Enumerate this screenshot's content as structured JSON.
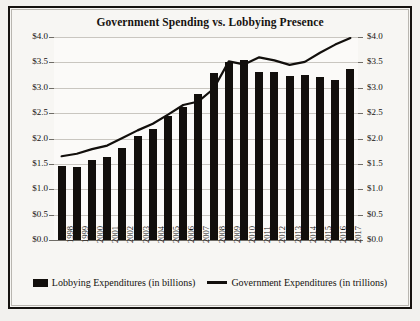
{
  "chart_data": {
    "type": "bar",
    "title": "Government Spending vs. Lobbying Presence",
    "xlabel": "",
    "ylabel": "",
    "ylim": [
      0.0,
      4.0
    ],
    "ytick_step": 0.5,
    "grid": true,
    "legend_position": "bottom",
    "dual_axis": true,
    "categories": [
      "1998",
      "1999",
      "2000",
      "2001",
      "2002",
      "2003",
      "2004",
      "2005",
      "2006",
      "2007",
      "2008",
      "2009",
      "2010",
      "2011",
      "2012",
      "2013",
      "2014",
      "2015",
      "2016",
      "2017"
    ],
    "yticks": [
      "$0.0",
      "$0.5",
      "$1.0",
      "$1.5",
      "$2.0",
      "$2.5",
      "$3.0",
      "$3.5",
      "$4.0"
    ],
    "ytick_values": [
      0.0,
      0.5,
      1.0,
      1.5,
      2.0,
      2.5,
      3.0,
      3.5,
      4.0
    ],
    "series": [
      {
        "name": "Lobbying Expenditures (in billions)",
        "type": "bar",
        "color": "#120f0c",
        "values": [
          1.45,
          1.44,
          1.57,
          1.64,
          1.82,
          2.05,
          2.19,
          2.44,
          2.63,
          2.87,
          3.3,
          3.5,
          3.55,
          3.32,
          3.31,
          3.24,
          3.26,
          3.22,
          3.15,
          3.37
        ]
      },
      {
        "name": "Government Expenditures (in trillions)",
        "type": "line",
        "color": "#120f0c",
        "values": [
          1.65,
          1.7,
          1.79,
          1.86,
          2.01,
          2.16,
          2.29,
          2.47,
          2.66,
          2.73,
          2.98,
          3.52,
          3.46,
          3.6,
          3.54,
          3.45,
          3.51,
          3.69,
          3.85,
          3.98
        ]
      }
    ]
  },
  "legend": {
    "items": [
      {
        "label": "Lobbying Expenditures (in billions)",
        "marker": "bar-swatch-icon"
      },
      {
        "label": "Government Expenditures (in trillions)",
        "marker": "line-swatch-icon"
      }
    ]
  }
}
